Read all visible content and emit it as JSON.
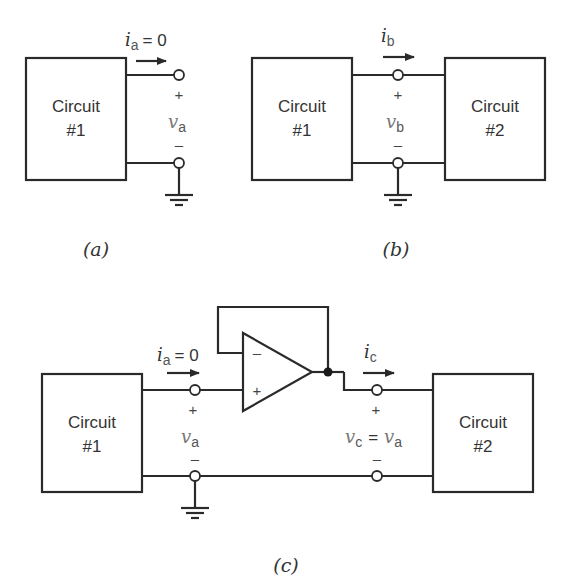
{
  "figure": {
    "panels": [
      {
        "id": "a",
        "caption": "(a)",
        "circuit1": {
          "line1": "Circuit",
          "line2": "#1"
        },
        "current": {
          "symbol": "i",
          "subscript": "a",
          "value": "= 0"
        },
        "voltage": {
          "symbol": "v",
          "subscript": "a",
          "plus": "+",
          "minus": "–"
        }
      },
      {
        "id": "b",
        "caption": "(b)",
        "circuit1": {
          "line1": "Circuit",
          "line2": "#1"
        },
        "circuit2": {
          "line1": "Circuit",
          "line2": "#2"
        },
        "current": {
          "symbol": "i",
          "subscript": "b"
        },
        "voltage": {
          "symbol": "v",
          "subscript": "b",
          "plus": "+",
          "minus": "–"
        }
      },
      {
        "id": "c",
        "caption": "(c)",
        "circuit1": {
          "line1": "Circuit",
          "line2": "#1"
        },
        "circuit2": {
          "line1": "Circuit",
          "line2": "#2"
        },
        "current_in": {
          "symbol": "i",
          "subscript": "a",
          "value": "= 0"
        },
        "current_out": {
          "symbol": "i",
          "subscript": "c"
        },
        "voltage_in": {
          "symbol": "v",
          "subscript": "a",
          "plus": "+",
          "minus": "–"
        },
        "voltage_out": {
          "symbol": "v",
          "subscript": "c",
          "equals": "=",
          "symbol2": "v",
          "subscript2": "a",
          "plus": "+",
          "minus": "–"
        },
        "opamp": {
          "inverting": "–",
          "noninverting": "+"
        }
      }
    ]
  }
}
